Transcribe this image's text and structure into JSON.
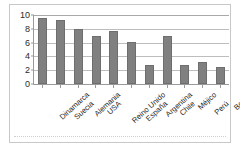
{
  "chart_data": {
    "type": "bar",
    "title": "",
    "subtitle": "",
    "xlabel": "",
    "ylabel": "",
    "categories": [
      "Dinamarca",
      "Suecia",
      "Alemania",
      "USA",
      "Reino Unido",
      "España",
      "Argentina",
      "Chile",
      "Méjico",
      "Perú",
      "Bolivia"
    ],
    "values": [
      9.5,
      9.3,
      8.0,
      7.0,
      7.7,
      6.1,
      2.8,
      7.0,
      2.8,
      3.2,
      2.5
    ],
    "ylim": [
      0,
      10
    ],
    "yticks": [
      0,
      2,
      4,
      6,
      8,
      10
    ],
    "ytick_labels": [
      "0",
      "2",
      "4",
      "6",
      "8",
      "10"
    ],
    "grid": true,
    "grid_axis": "y",
    "legend": false,
    "legend_position": "none",
    "bar_color": "#808080",
    "bar_edge_color": "#6e6e6e",
    "grid_color": "#bdbdbd",
    "axis_color": "#9a9a9a",
    "background_color": "#ffffff",
    "frame_color": "#c8c8c8"
  }
}
